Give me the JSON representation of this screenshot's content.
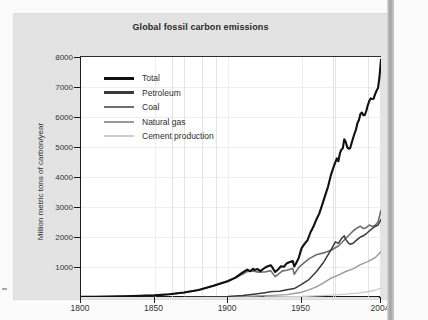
{
  "chart_data": {
    "type": "line",
    "title": "Global fossil carbon emissions",
    "xlabel": "",
    "ylabel": "Million metric tons of carbon/year",
    "xlim": [
      1800,
      2004
    ],
    "ylim": [
      0,
      8000
    ],
    "grid": true,
    "legend_position": "top-left",
    "xticks": [
      "1800",
      "1850",
      "1900",
      "1950",
      "2004"
    ],
    "xtick_values": [
      1800,
      1850,
      1900,
      1950,
      2004
    ],
    "yticks": [
      "1000",
      "2000",
      "3000",
      "4000",
      "5000",
      "6000",
      "7000",
      "8000"
    ],
    "ytick_values": [
      1000,
      2000,
      3000,
      4000,
      5000,
      6000,
      7000,
      8000
    ],
    "series": [
      {
        "name": "Total",
        "color": "#101010",
        "width": 2.1,
        "points": [
          [
            1800,
            8
          ],
          [
            1810,
            10
          ],
          [
            1820,
            17
          ],
          [
            1830,
            24
          ],
          [
            1840,
            38
          ],
          [
            1850,
            54
          ],
          [
            1860,
            91
          ],
          [
            1870,
            148
          ],
          [
            1880,
            236
          ],
          [
            1890,
            375
          ],
          [
            1900,
            534
          ],
          [
            1905,
            645
          ],
          [
            1910,
            819
          ],
          [
            1913,
            911
          ],
          [
            1915,
            858
          ],
          [
            1917,
            942
          ],
          [
            1918,
            900
          ],
          [
            1920,
            932
          ],
          [
            1922,
            861
          ],
          [
            1925,
            975
          ],
          [
            1927,
            1026
          ],
          [
            1929,
            1058
          ],
          [
            1930,
            995
          ],
          [
            1932,
            833
          ],
          [
            1934,
            917
          ],
          [
            1936,
            1027
          ],
          [
            1938,
            1009
          ],
          [
            1940,
            1128
          ],
          [
            1942,
            1168
          ],
          [
            1944,
            1196
          ],
          [
            1945,
            1018
          ],
          [
            1946,
            1100
          ],
          [
            1948,
            1295
          ],
          [
            1950,
            1630
          ],
          [
            1952,
            1770
          ],
          [
            1954,
            1890
          ],
          [
            1956,
            2150
          ],
          [
            1958,
            2340
          ],
          [
            1960,
            2577
          ],
          [
            1962,
            2780
          ],
          [
            1964,
            3070
          ],
          [
            1966,
            3380
          ],
          [
            1968,
            3680
          ],
          [
            1970,
            4075
          ],
          [
            1972,
            4370
          ],
          [
            1974,
            4620
          ],
          [
            1975,
            4527
          ],
          [
            1976,
            4776
          ],
          [
            1977,
            4910
          ],
          [
            1978,
            4950
          ],
          [
            1979,
            5255
          ],
          [
            1980,
            5172
          ],
          [
            1981,
            5000
          ],
          [
            1982,
            4940
          ],
          [
            1983,
            4960
          ],
          [
            1984,
            5130
          ],
          [
            1985,
            5290
          ],
          [
            1986,
            5450
          ],
          [
            1987,
            5580
          ],
          [
            1988,
            5800
          ],
          [
            1989,
            5900
          ],
          [
            1990,
            6100
          ],
          [
            1991,
            6150
          ],
          [
            1992,
            6060
          ],
          [
            1993,
            6070
          ],
          [
            1994,
            6200
          ],
          [
            1995,
            6390
          ],
          [
            1996,
            6530
          ],
          [
            1997,
            6620
          ],
          [
            1998,
            6600
          ],
          [
            1999,
            6610
          ],
          [
            2000,
            6760
          ],
          [
            2001,
            6880
          ],
          [
            2002,
            6970
          ],
          [
            2003,
            7350
          ],
          [
            2004,
            7910
          ]
        ]
      },
      {
        "name": "Petroleum",
        "color": "#3a3a3a",
        "width": 1.5,
        "points": [
          [
            1870,
            1
          ],
          [
            1880,
            3
          ],
          [
            1890,
            10
          ],
          [
            1900,
            20
          ],
          [
            1910,
            50
          ],
          [
            1920,
            110
          ],
          [
            1925,
            145
          ],
          [
            1930,
            185
          ],
          [
            1935,
            190
          ],
          [
            1940,
            240
          ],
          [
            1945,
            280
          ],
          [
            1950,
            420
          ],
          [
            1955,
            580
          ],
          [
            1960,
            840
          ],
          [
            1965,
            1160
          ],
          [
            1970,
            1570
          ],
          [
            1973,
            1840
          ],
          [
            1975,
            1790
          ],
          [
            1977,
            1940
          ],
          [
            1979,
            2040
          ],
          [
            1980,
            1920
          ],
          [
            1982,
            1790
          ],
          [
            1983,
            1760
          ],
          [
            1985,
            1790
          ],
          [
            1987,
            1880
          ],
          [
            1989,
            1960
          ],
          [
            1990,
            2000
          ],
          [
            1992,
            2040
          ],
          [
            1994,
            2110
          ],
          [
            1996,
            2200
          ],
          [
            1998,
            2280
          ],
          [
            2000,
            2350
          ],
          [
            2002,
            2400
          ],
          [
            2004,
            2580
          ]
        ]
      },
      {
        "name": "Coal",
        "color": "#6e6e6e",
        "width": 1.6,
        "points": [
          [
            1800,
            8
          ],
          [
            1820,
            17
          ],
          [
            1840,
            38
          ],
          [
            1850,
            54
          ],
          [
            1860,
            90
          ],
          [
            1870,
            147
          ],
          [
            1880,
            233
          ],
          [
            1890,
            365
          ],
          [
            1900,
            514
          ],
          [
            1910,
            769
          ],
          [
            1913,
            850
          ],
          [
            1917,
            870
          ],
          [
            1920,
            830
          ],
          [
            1925,
            835
          ],
          [
            1929,
            880
          ],
          [
            1932,
            680
          ],
          [
            1937,
            870
          ],
          [
            1940,
            890
          ],
          [
            1944,
            950
          ],
          [
            1945,
            760
          ],
          [
            1948,
            980
          ],
          [
            1950,
            1070
          ],
          [
            1955,
            1270
          ],
          [
            1960,
            1410
          ],
          [
            1965,
            1470
          ],
          [
            1970,
            1560
          ],
          [
            1975,
            1700
          ],
          [
            1980,
            1950
          ],
          [
            1985,
            2200
          ],
          [
            1988,
            2310
          ],
          [
            1990,
            2360
          ],
          [
            1992,
            2280
          ],
          [
            1994,
            2310
          ],
          [
            1996,
            2400
          ],
          [
            1998,
            2350
          ],
          [
            2000,
            2390
          ],
          [
            2002,
            2500
          ],
          [
            2004,
            2890
          ]
        ]
      },
      {
        "name": "Natural gas",
        "color": "#9a9a9a",
        "width": 1.4,
        "points": [
          [
            1885,
            1
          ],
          [
            1900,
            8
          ],
          [
            1910,
            20
          ],
          [
            1920,
            35
          ],
          [
            1930,
            55
          ],
          [
            1940,
            80
          ],
          [
            1950,
            160
          ],
          [
            1955,
            240
          ],
          [
            1960,
            340
          ],
          [
            1965,
            470
          ],
          [
            1970,
            630
          ],
          [
            1975,
            730
          ],
          [
            1980,
            850
          ],
          [
            1985,
            940
          ],
          [
            1990,
            1080
          ],
          [
            1995,
            1180
          ],
          [
            2000,
            1310
          ],
          [
            2004,
            1510
          ]
        ]
      },
      {
        "name": "Cement production",
        "color": "#cacaca",
        "width": 1.3,
        "points": [
          [
            1925,
            6
          ],
          [
            1940,
            12
          ],
          [
            1950,
            18
          ],
          [
            1960,
            35
          ],
          [
            1970,
            60
          ],
          [
            1980,
            95
          ],
          [
            1990,
            140
          ],
          [
            1995,
            175
          ],
          [
            2000,
            225
          ],
          [
            2004,
            298
          ]
        ]
      }
    ]
  },
  "figure": {
    "title": "Global fossil carbon emissions",
    "y_axis_title": "Million metric tons of carbon/year"
  },
  "legend": {
    "items": [
      {
        "label": "Total",
        "color": "#101010"
      },
      {
        "label": "Petroleum",
        "color": "#3a3a3a"
      },
      {
        "label": "Coal",
        "color": "#6e6e6e"
      },
      {
        "label": "Natural gas",
        "color": "#9a9a9a"
      },
      {
        "label": "Cement production",
        "color": "#cacaca"
      }
    ]
  },
  "axes": {
    "y_labels": [
      "8000",
      "7000",
      "6000",
      "5000",
      "4000",
      "3000",
      "2000",
      "1000"
    ],
    "x_labels": [
      "1800",
      "1850",
      "1900",
      "1950",
      "2004"
    ]
  }
}
